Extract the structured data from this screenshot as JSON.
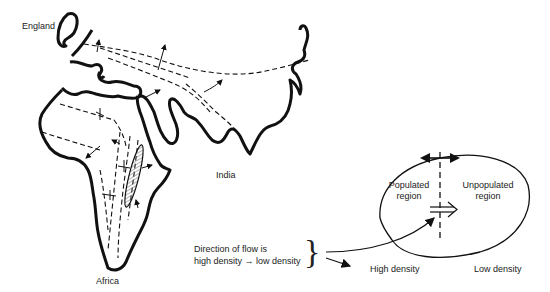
{
  "map": {
    "labels": {
      "england": "England",
      "india": "India",
      "africa": "Africa"
    }
  },
  "legend": {
    "caption_line1": "Direction of flow is",
    "caption_line2": "high density → low density",
    "brace": "}",
    "populated": [
      "Populated",
      "region"
    ],
    "unpopulated": [
      "Unpopulated",
      "region"
    ],
    "high_density": "High density",
    "low_density": "Low density"
  },
  "colors": {
    "stroke": "#111111",
    "background": "#ffffff",
    "hatch": "#666666"
  }
}
